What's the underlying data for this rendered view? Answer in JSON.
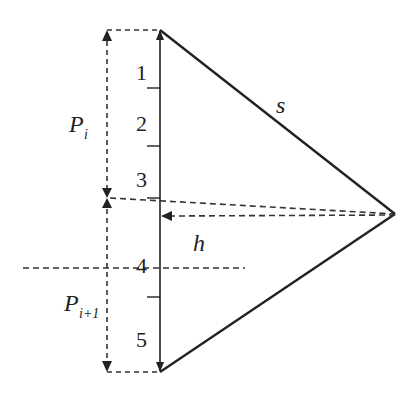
{
  "diagram": {
    "colors": {
      "line": "#222222",
      "dash": "#333333",
      "background": "#ffffff"
    },
    "segments": [
      {
        "id": "1",
        "label": "1"
      },
      {
        "id": "2",
        "label": "2"
      },
      {
        "id": "3",
        "label": "3"
      },
      {
        "id": "4",
        "label": "4"
      },
      {
        "id": "5",
        "label": "5"
      }
    ],
    "labels": {
      "s": "s",
      "h": "h",
      "p_i_main": "P",
      "p_i_sub": "i",
      "p_i1_main": "P",
      "p_i1_sub": "i+1"
    }
  }
}
